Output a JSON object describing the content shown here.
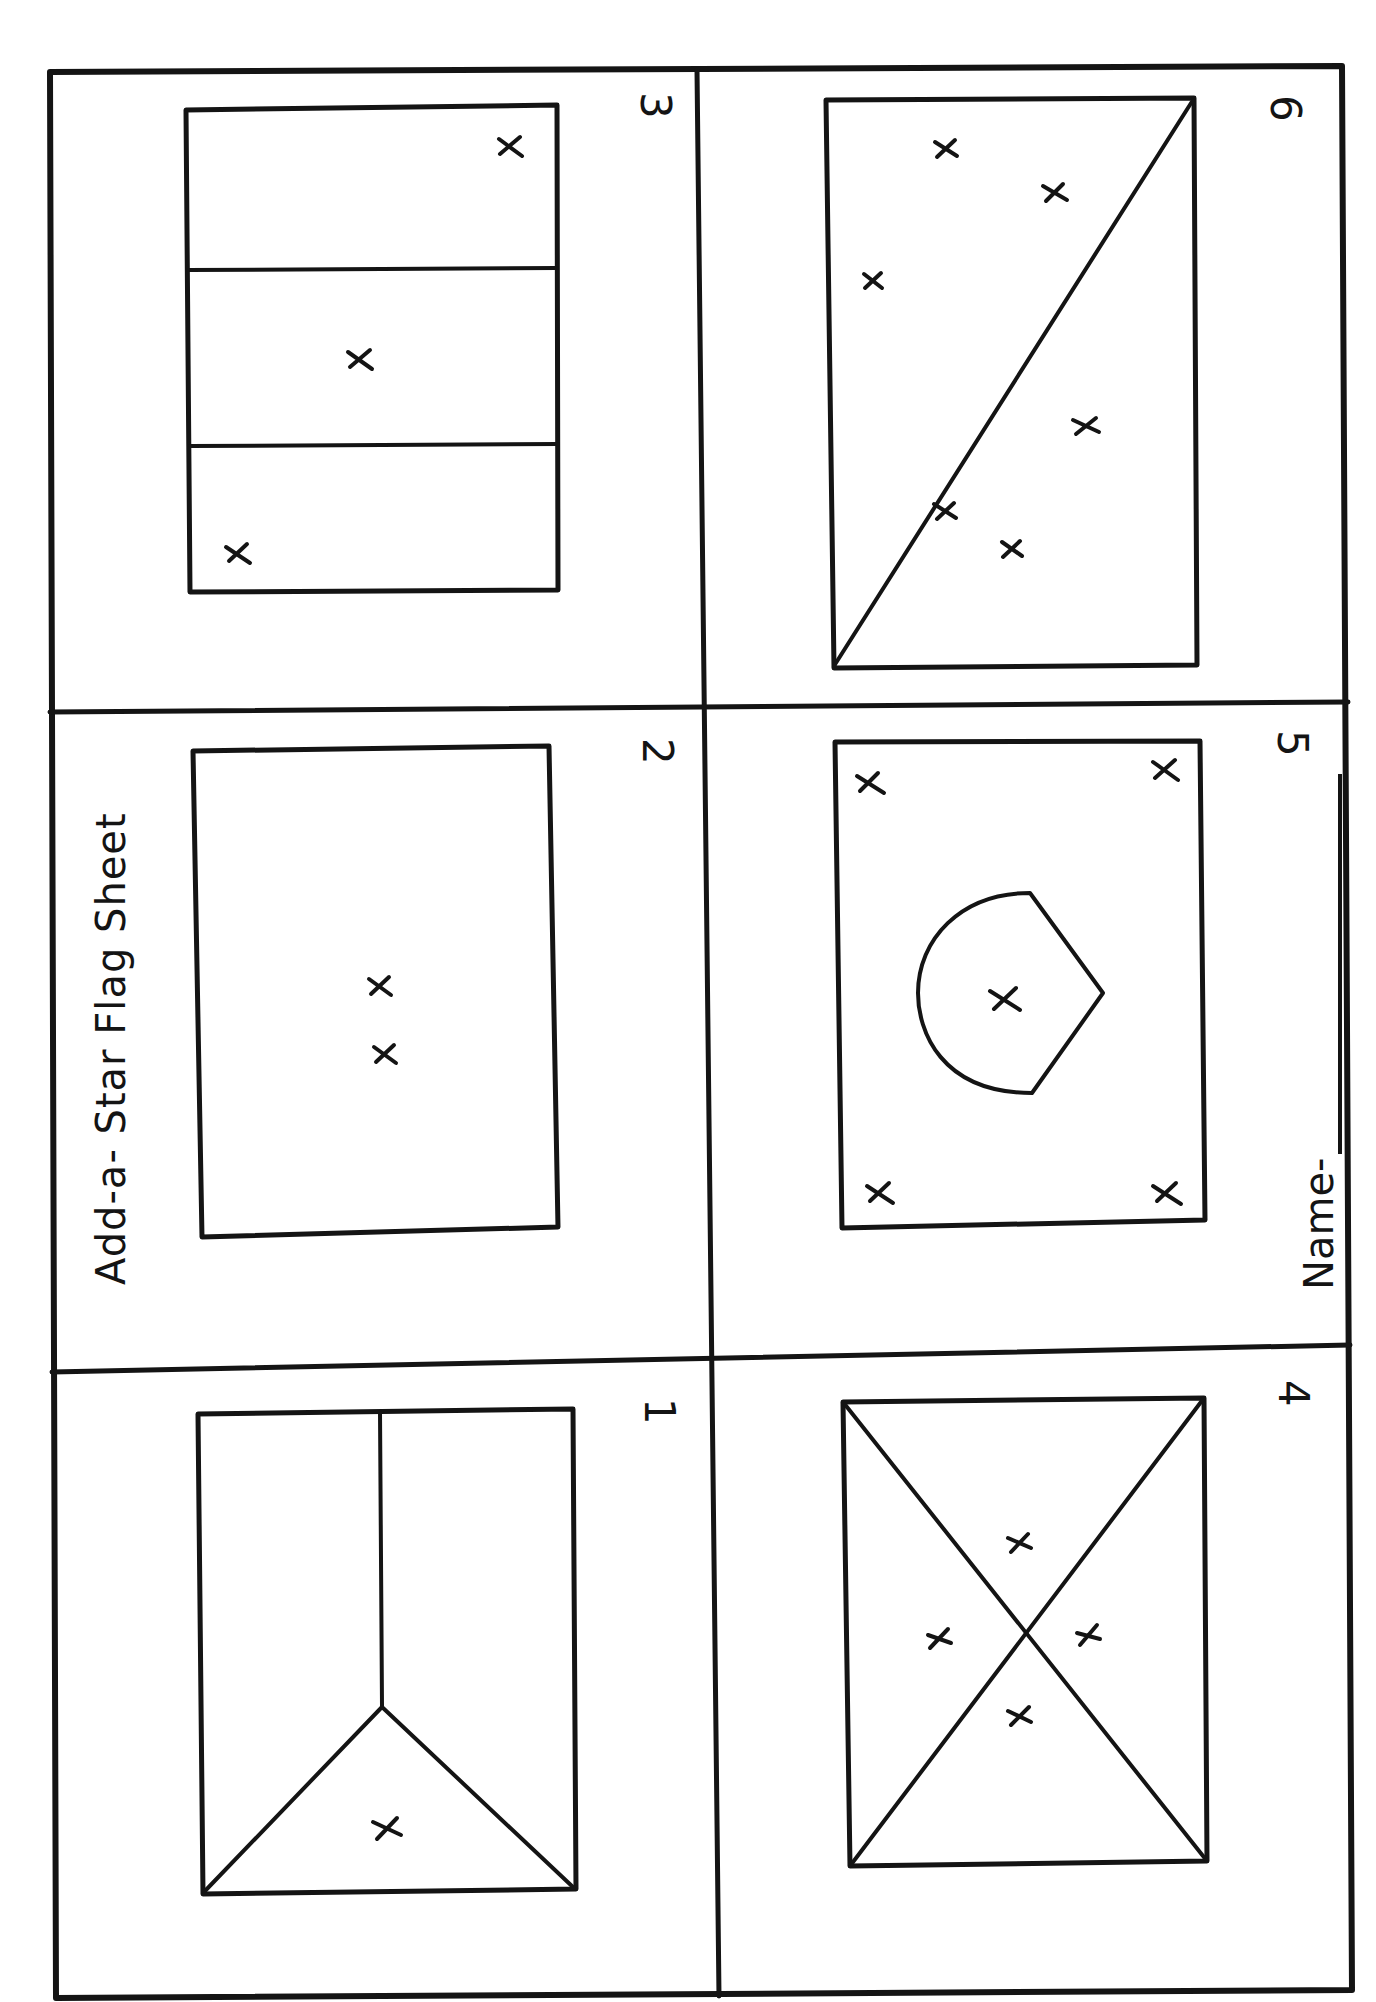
{
  "sheet": {
    "title": "Add-a- Star Flag Sheet",
    "name_label": "Name-",
    "name_value": "",
    "orientation": "rotated 90° counter-clockwise on page",
    "ink_color": "#141414",
    "paper_color": "#ffffff"
  },
  "panels": [
    {
      "number": "1",
      "design": "chevron-triangle with vertical split",
      "star_count": 1,
      "stars": [
        [
          387,
          1830
        ]
      ]
    },
    {
      "number": "2",
      "design": "plain field",
      "star_count": 2,
      "stars": [
        [
          380,
          987
        ],
        [
          384,
          1055
        ]
      ]
    },
    {
      "number": "3",
      "design": "three horizontal bands",
      "star_count": 3,
      "stars": [
        [
          510,
          147
        ],
        [
          360,
          360
        ],
        [
          238,
          555
        ]
      ]
    },
    {
      "number": "4",
      "design": "diagonal saltire cross",
      "star_count": 4,
      "stars": [
        [
          1026,
          1545
        ],
        [
          938,
          1637
        ],
        [
          1090,
          1633
        ],
        [
          1021,
          1718
        ]
      ]
    },
    {
      "number": "5",
      "design": "shield emblem with corner stars",
      "star_count": 5,
      "stars": [
        [
          870,
          785
        ],
        [
          1165,
          770
        ],
        [
          1005,
          1000
        ],
        [
          880,
          1195
        ],
        [
          1165,
          1195
        ]
      ]
    },
    {
      "number": "6",
      "design": "single diagonal split",
      "star_count": 6,
      "stars": [
        [
          946,
          149
        ],
        [
          1055,
          193
        ],
        [
          873,
          281
        ],
        [
          1086,
          426
        ],
        [
          945,
          512
        ],
        [
          1012,
          549
        ]
      ]
    }
  ]
}
